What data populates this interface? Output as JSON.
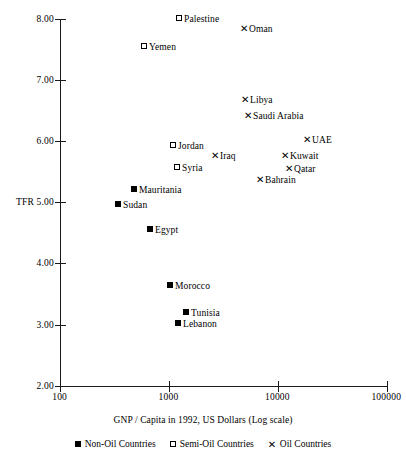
{
  "chart_data": {
    "type": "scatter",
    "title": "",
    "xlabel": "GNP / Capita in 1992, US Dollars (Log scale)",
    "ylabel": "TFR",
    "xscale": "log",
    "xlim": [
      100,
      100000
    ],
    "ylim": [
      2.0,
      8.0
    ],
    "xticks": [
      "100",
      "1000",
      "10000",
      "100000"
    ],
    "yticks": [
      "2.00",
      "3.00",
      "4.00",
      "5.00",
      "6.00",
      "7.00",
      "8.00"
    ],
    "grid": false,
    "legend_position": "below-axis-title",
    "series": [
      {
        "name": "Non-Oil Countries",
        "marker": "filled-square",
        "points": [
          {
            "label": "Mauritania",
            "x": 530,
            "y": 5.25,
            "px": 131,
            "py": 189
          },
          {
            "label": "Sudan",
            "x": 390,
            "y": 5.02,
            "px": 115,
            "py": 204
          },
          {
            "label": "Egypt",
            "x": 670,
            "y": 4.57,
            "px": 147,
            "py": 229
          },
          {
            "label": "Morocco",
            "x": 1000,
            "y": 3.65,
            "px": 167,
            "py": 285
          },
          {
            "label": "Tunisia",
            "x": 1300,
            "y": 3.2,
            "px": 183,
            "py": 312
          },
          {
            "label": "Lebanon",
            "x": 1150,
            "y": 3.02,
            "px": 175,
            "py": 323
          }
        ]
      },
      {
        "name": "Semi-Oil Countries",
        "marker": "open-square",
        "points": [
          {
            "label": "Palestine",
            "x": 1400,
            "y": 7.98,
            "px": 176,
            "py": 18
          },
          {
            "label": "Yemen",
            "x": 740,
            "y": 7.52,
            "px": 141,
            "py": 46
          },
          {
            "label": "Jordan",
            "x": 1100,
            "y": 5.9,
            "px": 170,
            "py": 145
          },
          {
            "label": "Syria",
            "x": 1180,
            "y": 5.54,
            "px": 174,
            "py": 167
          }
        ]
      },
      {
        "name": "Oil Countries",
        "marker": "cross",
        "points": [
          {
            "label": "Oman",
            "x": 5000,
            "y": 7.82,
            "px": 240,
            "py": 28
          },
          {
            "label": "Libya",
            "x": 5100,
            "y": 6.65,
            "px": 241,
            "py": 99
          },
          {
            "label": "Saudi Arabia",
            "x": 5300,
            "y": 6.38,
            "px": 244,
            "py": 115
          },
          {
            "label": "UAE",
            "x": 19000,
            "y": 5.93,
            "px": 303,
            "py": 139
          },
          {
            "label": "Iraq",
            "x": 2300,
            "y": 5.67,
            "px": 211,
            "py": 155
          },
          {
            "label": "Kuwait",
            "x": 13000,
            "y": 5.67,
            "px": 281,
            "py": 155
          },
          {
            "label": "Qatar",
            "x": 14000,
            "y": 5.45,
            "px": 285,
            "py": 168
          },
          {
            "label": "Bahrain",
            "x": 7300,
            "y": 5.27,
            "px": 256,
            "py": 179
          }
        ]
      }
    ]
  },
  "axes": {
    "y_label_text": "TFR",
    "y_ticks": [
      {
        "label": "8.00",
        "py": 19
      },
      {
        "label": "7.00",
        "py": 80
      },
      {
        "label": "6.00",
        "py": 141
      },
      {
        "label": "5.00",
        "py": 202
      },
      {
        "label": "4.00",
        "py": 263
      },
      {
        "label": "3.00",
        "py": 325
      },
      {
        "label": "2.00",
        "py": 386
      }
    ],
    "x_ticks": [
      {
        "label": "100",
        "px": 60
      },
      {
        "label": "1000",
        "px": 169
      },
      {
        "label": "10000",
        "px": 278
      },
      {
        "label": "100000",
        "px": 387
      }
    ],
    "x_title": "GNP / Capita in 1992, US Dollars (Log scale)"
  },
  "legend": {
    "items": [
      {
        "label": "Non-Oil Countries",
        "marker": "filled-square"
      },
      {
        "label": "Semi-Oil Countries",
        "marker": "open-square"
      },
      {
        "label": "Oil Countries",
        "marker": "cross"
      }
    ]
  },
  "colors": {
    "axis": "#1a1a1a",
    "text": "#000000",
    "marker": "#000000",
    "background": "#ffffff"
  },
  "glyphs": {
    "cross": "✕"
  }
}
